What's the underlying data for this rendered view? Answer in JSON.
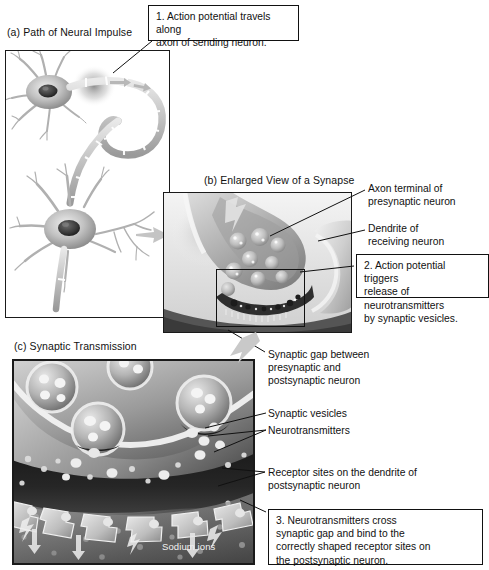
{
  "figure": {
    "panels": [
      {
        "id": "a",
        "label": "(a) Path of Neural Impulse"
      },
      {
        "id": "b",
        "label": "(b) Enlarged View of a Synapse"
      },
      {
        "id": "c",
        "label": "(c) Synaptic Transmission"
      }
    ]
  },
  "callouts": [
    {
      "id": "step-1",
      "number": "1.",
      "text": "1. Action potential travels along axon of sending neuron.",
      "line1": "1. Action potential travels along",
      "line2": "axon of sending neuron."
    },
    {
      "id": "step-2",
      "number": "2.",
      "text": "2. Action potential triggers release of neurotransmitters by synaptic vesicles.",
      "line1": "2. Action potential triggers",
      "line2": "release of neurotransmitters",
      "line3": "by synaptic vesicles."
    },
    {
      "id": "step-3",
      "number": "3.",
      "text": "3. Neurotransmitters cross synaptic gap and bind to the correctly shaped receptor sites on the postsynaptic neuron.",
      "line1": "3. Neurotransmitters cross",
      "line2": "synaptic gap and bind to the",
      "line3": "correctly shaped receptor sites on",
      "line4": "the postsynaptic neuron."
    }
  ],
  "labels": {
    "axon_terminal": "Axon terminal of\npresynaptic neuron",
    "dendrite": "Dendrite of\nreceiving neuron",
    "synaptic_gap": "Synaptic gap between\npresynaptic and\npostsynaptic neuron",
    "synaptic_vesicles": "Synaptic vesicles",
    "neurotransmitters": "Neurotransmitters",
    "receptor_sites": "Receptor sites on the dendrite of\npostsynaptic neuron",
    "sodium_ions": "Sodium ions"
  },
  "colors": {
    "ink": "#111111",
    "frame": "#1a1a1a",
    "page": "#ffffff",
    "cell_light": "#d8d8d8",
    "cell_mid": "#a9a9a9",
    "cell_dark": "#6f6f6f",
    "synapse_dark": "#2b2b2b",
    "panel_c_dark": "#3a3a3a",
    "panel_c_light": "#cfcfcf"
  }
}
